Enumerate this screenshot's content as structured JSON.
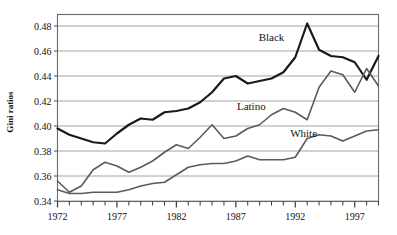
{
  "chart_data": {
    "type": "line",
    "title": "",
    "xlabel": "",
    "ylabel": "Gini ratios",
    "xlim": [
      1972,
      1999
    ],
    "ylim": [
      0.34,
      0.49
    ],
    "ytick_labels": [
      "0.48",
      "0.46",
      "0.44",
      "0.42",
      "0.40",
      "0.38",
      "0.36",
      "0.34"
    ],
    "ytick_values": [
      0.48,
      0.46,
      0.44,
      0.42,
      0.4,
      0.38,
      0.36,
      0.34
    ],
    "xtick_labels": [
      "1972",
      "1977",
      "1982",
      "1987",
      "1992",
      "1997"
    ],
    "xtick_values": [
      1972,
      1977,
      1982,
      1987,
      1992,
      1997
    ],
    "grid": true,
    "legend_position": "inline-annotations",
    "x": [
      1972,
      1973,
      1974,
      1975,
      1976,
      1977,
      1978,
      1979,
      1980,
      1981,
      1982,
      1983,
      1984,
      1985,
      1986,
      1987,
      1988,
      1989,
      1990,
      1991,
      1992,
      1993,
      1994,
      1995,
      1996,
      1997,
      1998,
      1999
    ],
    "series": [
      {
        "name": "Black",
        "color": "#1a1a1a",
        "width": 2.2,
        "label_x": 1990.0,
        "label_y": 0.468,
        "values": [
          0.398,
          0.393,
          0.39,
          0.387,
          0.386,
          0.394,
          0.401,
          0.406,
          0.405,
          0.411,
          0.412,
          0.414,
          0.419,
          0.427,
          0.438,
          0.44,
          0.434,
          0.436,
          0.438,
          0.443,
          0.455,
          0.482,
          0.461,
          0.456,
          0.455,
          0.451,
          0.437,
          0.456
        ]
      },
      {
        "name": "Latino",
        "color": "#5a5a5a",
        "width": 1.6,
        "label_x": 1988.3,
        "label_y": 0.4125,
        "values": [
          0.356,
          0.347,
          0.352,
          0.365,
          0.371,
          0.368,
          0.363,
          0.367,
          0.372,
          0.379,
          0.385,
          0.382,
          0.391,
          0.401,
          0.39,
          0.392,
          0.398,
          0.401,
          0.409,
          0.414,
          0.411,
          0.405,
          0.431,
          0.444,
          0.441,
          0.427,
          0.446,
          0.432
        ]
      },
      {
        "name": "White",
        "color": "#5a5a5a",
        "width": 1.6,
        "label_x": 1992.7,
        "label_y": 0.3915,
        "values": [
          0.349,
          0.346,
          0.346,
          0.347,
          0.347,
          0.347,
          0.349,
          0.352,
          0.354,
          0.355,
          0.361,
          0.367,
          0.369,
          0.37,
          0.37,
          0.372,
          0.376,
          0.373,
          0.373,
          0.373,
          0.375,
          0.39,
          0.393,
          0.392,
          0.388,
          0.392,
          0.396,
          0.397
        ]
      }
    ]
  },
  "axes": {
    "yaxis_title": "Gini ratios"
  }
}
